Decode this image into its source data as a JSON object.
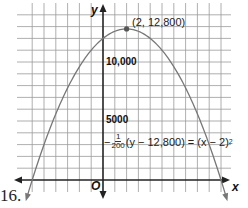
{
  "problem_number": "16.",
  "chart_data": {
    "type": "line",
    "title": "",
    "equation": "-1/200(y - 12,800) = (x - 2)^2",
    "function": "y = 12800 - 200(x - 2)^2",
    "xlabel": "x",
    "ylabel": "y",
    "origin_label": "O",
    "x_range": [
      -7,
      10.5
    ],
    "y_range": [
      -1000,
      14500
    ],
    "x_grid_step": 1,
    "y_grid_step": 1000,
    "y_tick_labels": [
      {
        "value": 10000,
        "label": "10,000"
      },
      {
        "value": 5000,
        "label": "5000"
      }
    ],
    "grid": true,
    "vertex": {
      "x": 2,
      "y": 12800,
      "label": "(2, 12,800)"
    },
    "x_intercepts": [
      -6,
      10
    ],
    "y_intercept": 12000,
    "points": [
      {
        "x": -6.5,
        "y": -1650
      },
      {
        "x": -6,
        "y": 0
      },
      {
        "x": -4,
        "y": 5600
      },
      {
        "x": -2,
        "y": 9600
      },
      {
        "x": 0,
        "y": 12000
      },
      {
        "x": 2,
        "y": 12800
      },
      {
        "x": 4,
        "y": 12000
      },
      {
        "x": 6,
        "y": 9600
      },
      {
        "x": 8,
        "y": 5600
      },
      {
        "x": 10,
        "y": 0
      },
      {
        "x": 10.5,
        "y": -1650
      }
    ]
  },
  "labels": {
    "vertex": "(2, 12,800)",
    "y_tick_10000": "10,000",
    "y_tick_5000": "5000",
    "x_axis": "x",
    "y_axis": "y",
    "origin": "O",
    "eq_prefix": "−",
    "eq_num": "1",
    "eq_den": "200",
    "eq_mid": "(y − 12,800) = (x − 2)",
    "eq_exp": "2"
  }
}
